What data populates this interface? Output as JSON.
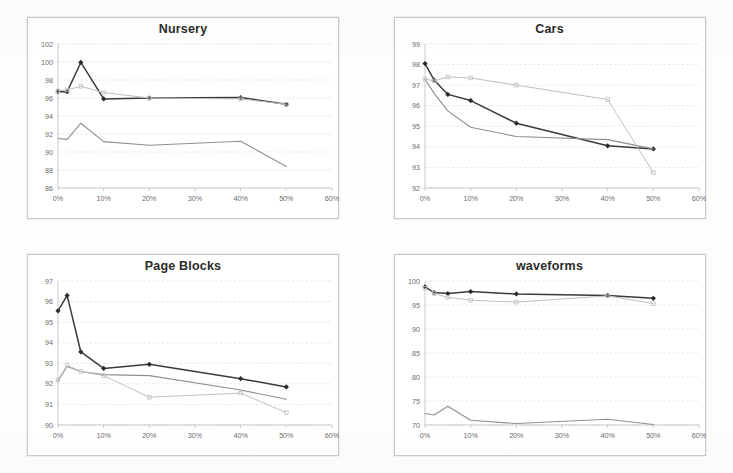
{
  "page": {
    "layout": "2x2-chart-grid",
    "background_color": "#ffffff",
    "panel_border_color": "#c9c9c9"
  },
  "colors": {
    "series_dark": "#3a3a3a",
    "series_mid": "#8f8f8f",
    "series_light": "#c0c0c0",
    "gridline": "#d8d8d8",
    "tick_label": "#6b6b6b",
    "title": "#2b2b2b"
  },
  "chart_data": [
    {
      "type": "line",
      "title": "Nursery",
      "xlabel": "",
      "ylabel": "",
      "xlim": [
        0,
        60
      ],
      "ylim": [
        86,
        102
      ],
      "ytick_step": 2,
      "xtick_step": 10,
      "grid": true,
      "legend": "none",
      "xticks": [
        "0%",
        "10%",
        "20%",
        "30%",
        "40%",
        "50%",
        "60%"
      ],
      "yticks": [
        "86",
        "88",
        "90",
        "92",
        "94",
        "96",
        "98",
        "100",
        "102"
      ],
      "series": [
        {
          "name": "series-1-dark",
          "marker": "diamond",
          "x": [
            0,
            2,
            5,
            10,
            20,
            40,
            50
          ],
          "values": [
            96.7,
            96.7,
            99.95,
            95.9,
            96.0,
            96.05,
            95.3
          ]
        },
        {
          "name": "series-2-mid",
          "marker": "none",
          "x": [
            0,
            2,
            5,
            10,
            20,
            40,
            50
          ],
          "values": [
            91.5,
            91.4,
            93.2,
            91.15,
            90.75,
            91.2,
            88.4
          ]
        },
        {
          "name": "series-3-light",
          "marker": "square",
          "x": [
            0,
            2,
            5,
            10,
            20,
            40,
            50
          ],
          "values": [
            96.8,
            96.9,
            97.3,
            96.6,
            96.0,
            95.9,
            95.3
          ]
        }
      ]
    },
    {
      "type": "line",
      "title": "Cars",
      "xlabel": "",
      "ylabel": "",
      "xlim": [
        0,
        60
      ],
      "ylim": [
        92,
        99
      ],
      "ytick_step": 1,
      "xtick_step": 10,
      "grid": true,
      "legend": "none",
      "xticks": [
        "0%",
        "10%",
        "20%",
        "30%",
        "40%",
        "50%",
        "60%"
      ],
      "yticks": [
        "92",
        "93",
        "94",
        "95",
        "96",
        "97",
        "98",
        "99"
      ],
      "series": [
        {
          "name": "series-1-dark",
          "marker": "diamond",
          "x": [
            0,
            2,
            5,
            10,
            20,
            40,
            50
          ],
          "values": [
            98.05,
            97.25,
            96.55,
            96.25,
            95.15,
            94.05,
            93.9
          ]
        },
        {
          "name": "series-2-mid",
          "marker": "none",
          "x": [
            0,
            2,
            5,
            10,
            20,
            40,
            50
          ],
          "values": [
            97.3,
            96.6,
            95.75,
            94.95,
            94.5,
            94.35,
            93.9
          ]
        },
        {
          "name": "series-3-light",
          "marker": "square",
          "x": [
            0,
            2,
            5,
            10,
            20,
            40,
            50
          ],
          "values": [
            97.3,
            97.2,
            97.4,
            97.35,
            97.0,
            96.3,
            92.75
          ]
        }
      ]
    },
    {
      "type": "line",
      "title": "Page Blocks",
      "xlabel": "",
      "ylabel": "",
      "xlim": [
        0,
        60
      ],
      "ylim": [
        90,
        97
      ],
      "ytick_step": 1,
      "xtick_step": 10,
      "grid": true,
      "legend": "none",
      "xticks": [
        "0%",
        "10%",
        "20%",
        "30%",
        "40%",
        "50%",
        "60%"
      ],
      "yticks": [
        "90",
        "91",
        "92",
        "93",
        "94",
        "95",
        "96",
        "97"
      ],
      "series": [
        {
          "name": "series-1-dark",
          "marker": "diamond",
          "x": [
            0,
            2,
            5,
            10,
            20,
            40,
            50
          ],
          "values": [
            95.55,
            96.3,
            93.55,
            92.75,
            92.95,
            92.25,
            91.85
          ]
        },
        {
          "name": "series-2-mid",
          "marker": "none",
          "x": [
            0,
            2,
            5,
            10,
            20,
            40,
            50
          ],
          "values": [
            92.15,
            92.85,
            92.6,
            92.45,
            92.4,
            91.7,
            91.25
          ]
        },
        {
          "name": "series-3-light",
          "marker": "square",
          "x": [
            0,
            2,
            5,
            10,
            20,
            40,
            50
          ],
          "values": [
            92.2,
            92.9,
            92.6,
            92.4,
            91.35,
            91.55,
            90.6
          ]
        }
      ]
    },
    {
      "type": "line",
      "title": "waveforms",
      "xlabel": "",
      "ylabel": "",
      "xlim": [
        0,
        60
      ],
      "ylim": [
        70,
        100
      ],
      "ytick_step": 5,
      "xtick_step": 10,
      "grid": true,
      "legend": "none",
      "xticks": [
        "0%",
        "10%",
        "20%",
        "30%",
        "40%",
        "50%",
        "60%"
      ],
      "yticks": [
        "70",
        "75",
        "80",
        "85",
        "90",
        "95",
        "100"
      ],
      "series": [
        {
          "name": "series-1-dark",
          "marker": "diamond",
          "x": [
            0,
            2,
            5,
            10,
            20,
            40,
            50
          ],
          "values": [
            98.8,
            97.6,
            97.4,
            97.8,
            97.3,
            97.0,
            96.4
          ]
        },
        {
          "name": "series-2-mid",
          "marker": "none",
          "x": [
            0,
            2,
            5,
            10,
            20,
            40,
            50
          ],
          "values": [
            72.4,
            72.1,
            73.9,
            71.0,
            70.3,
            71.2,
            70.1
          ]
        },
        {
          "name": "series-3-light",
          "marker": "square",
          "x": [
            0,
            2,
            5,
            10,
            20,
            40,
            50
          ],
          "values": [
            98.5,
            97.4,
            96.6,
            96.0,
            95.6,
            96.9,
            95.3
          ]
        }
      ]
    }
  ]
}
